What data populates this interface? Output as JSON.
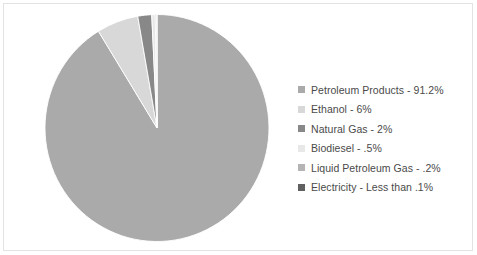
{
  "chart_data": {
    "type": "pie",
    "title": "",
    "subtitle": "",
    "legend_position": "right",
    "grid": false,
    "start_angle_deg": 0,
    "direction": "clockwise",
    "categories": [
      "Petroleum Products",
      "Ethanol",
      "Natural Gas",
      "Biodiesel",
      "Liquid Petroleum Gas",
      "Electricity"
    ],
    "values": [
      91.2,
      6,
      2,
      0.5,
      0.2,
      0.05
    ],
    "value_labels": [
      "91.2%",
      "6%",
      "2%",
      ".5%",
      ".2%",
      "Less than .1%"
    ],
    "colors": [
      "#aaaaaa",
      "#d8d8d8",
      "#888888",
      "#e8e8e8",
      "#b4b4b4",
      "#606060"
    ],
    "slices": [
      {
        "label": "Petroleum Products",
        "value": 91.2,
        "value_label": "91.2%",
        "color": "#aaaaaa"
      },
      {
        "label": "Ethanol",
        "value": 6,
        "value_label": "6%",
        "color": "#d8d8d8"
      },
      {
        "label": "Natural Gas",
        "value": 2,
        "value_label": "2%",
        "color": "#888888"
      },
      {
        "label": "Biodiesel",
        "value": 0.5,
        "value_label": ".5%",
        "color": "#e8e8e8"
      },
      {
        "label": "Liquid Petroleum Gas",
        "value": 0.2,
        "value_label": ".2%",
        "color": "#b4b4b4"
      },
      {
        "label": "Electricity",
        "value": 0.05,
        "value_label": "Less than .1%",
        "color": "#606060"
      }
    ]
  },
  "legend": {
    "items": [
      {
        "text": "Petroleum Products - 91.2%",
        "color": "#aaaaaa"
      },
      {
        "text": "Ethanol - 6%",
        "color": "#d8d8d8"
      },
      {
        "text": "Natural Gas - 2%",
        "color": "#888888"
      },
      {
        "text": "Biodiesel - .5%",
        "color": "#e8e8e8"
      },
      {
        "text": "Liquid Petroleum Gas - .2%",
        "color": "#b4b4b4"
      },
      {
        "text": "Electricity - Less than .1%",
        "color": "#606060"
      }
    ]
  },
  "style": {
    "background": "#ffffff",
    "border": "#e3e3e3",
    "text": "#4a4a4a"
  }
}
